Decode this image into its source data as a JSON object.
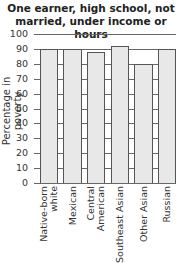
{
  "chart_data": {
    "type": "bar",
    "title": "One earner, high school, not married, under income or hours",
    "xlabel": "",
    "ylabel": "Percentage in poverty",
    "ylim": [
      0,
      100
    ],
    "yticks": [
      0,
      10,
      20,
      30,
      40,
      50,
      60,
      70,
      80,
      90,
      100
    ],
    "grid": true,
    "categories": [
      "Native-born white",
      "Mexican",
      "Central American",
      "Southeast Asian",
      "Other Asian",
      "Russian"
    ],
    "values": [
      90,
      90,
      88,
      92,
      80,
      90
    ],
    "bar_color": "#e8e8e8",
    "edge_color": "#555555"
  },
  "labels": {
    "title_line1": "One earner, high school, not",
    "title_line2": "married, under income or hours",
    "ylabel": "Percentage in poverty",
    "x": [
      [
        "Native-born",
        "white"
      ],
      [
        "Mexican"
      ],
      [
        "Central",
        "American"
      ],
      [
        "Southeast Asian"
      ],
      [
        "Other Asian"
      ],
      [
        "Russian"
      ]
    ]
  }
}
